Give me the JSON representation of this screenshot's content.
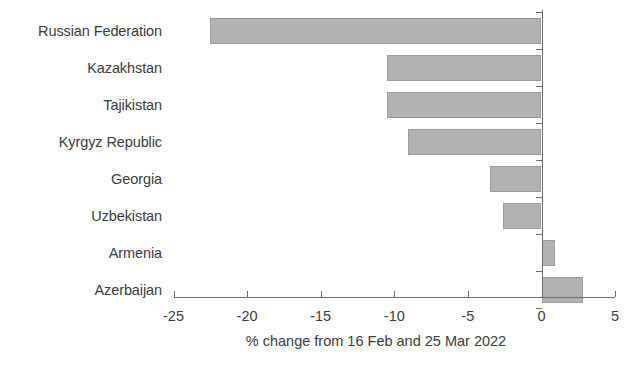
{
  "chart_data": {
    "type": "bar",
    "orientation": "horizontal",
    "title": "",
    "subtitle": "",
    "xlabel": "% change from 16 Feb and 25 Mar 2022",
    "ylabel": "",
    "categories": [
      "Russian Federation",
      "Kazakhstan",
      "Tajikistan",
      "Kyrgyz Republic",
      "Georgia",
      "Uzbekistan",
      "Armenia",
      "Azerbaijan"
    ],
    "values": [
      -22.5,
      -10.5,
      -10.5,
      -9.1,
      -3.5,
      -2.6,
      0.9,
      2.8
    ],
    "xlim": [
      -25,
      5
    ],
    "xticks": [
      -25,
      -20,
      -15,
      -10,
      -5,
      0,
      5
    ],
    "xtick_labels": [
      "-25",
      "-20",
      "-15",
      "-10",
      "-5",
      "0",
      "5"
    ],
    "grid": false,
    "legend": null,
    "bar_color": "#b2b2b2",
    "bar_border_color": "#9b9b9b",
    "axis_color": "#6e6e6e",
    "text_color": "#3c3c3c"
  }
}
